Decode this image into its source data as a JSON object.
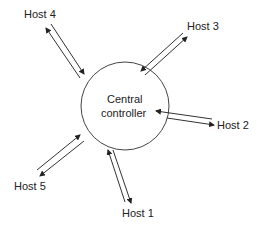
{
  "diagram": {
    "center": {
      "label_line1": "Central",
      "label_line2": "controller"
    },
    "hosts": [
      {
        "label": "Host 1"
      },
      {
        "label": "Host 2"
      },
      {
        "label": "Host 3"
      },
      {
        "label": "Host 4"
      },
      {
        "label": "Host 5"
      }
    ],
    "colors": {
      "line": "#333333",
      "text": "#222222",
      "background": "#ffffff"
    }
  }
}
